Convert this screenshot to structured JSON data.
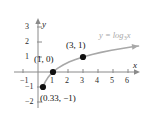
{
  "chart_data": {
    "type": "line",
    "title": "",
    "xlabel": "x",
    "ylabel": "y",
    "xlim": [
      -1.6,
      6.8
    ],
    "ylim": [
      -2.4,
      3.6
    ],
    "grid": false,
    "legend_position": "inline-right",
    "function_label": {
      "text": "y = log",
      "base": "3",
      "arg": "x",
      "color": "#a8a8a8"
    },
    "series": [
      {
        "name": "y = log_3 x",
        "color": "#a8a8a8",
        "arrow_end": true,
        "x": [
          0.3,
          0.33,
          0.4,
          0.5,
          0.65,
          0.8,
          1.0,
          1.3,
          1.7,
          2.1,
          2.5,
          3.0,
          3.6,
          4.2,
          4.9,
          5.6,
          6.3,
          6.7
        ],
        "y": [
          -1.1,
          -1.0,
          -0.83,
          -0.63,
          -0.39,
          -0.2,
          0.0,
          0.24,
          0.48,
          0.68,
          0.83,
          1.0,
          1.17,
          1.31,
          1.45,
          1.57,
          1.68,
          1.73
        ]
      }
    ],
    "points": [
      {
        "label": "(1, 0)",
        "x": 1,
        "y": 0,
        "label_dx": -19,
        "label_dy": -17
      },
      {
        "label": "(3, 1)",
        "x": 3,
        "y": 1,
        "label_dx": -17,
        "label_dy": -16
      },
      {
        "label": "(0.33, −1)",
        "x": 0.33,
        "y": -1,
        "label_dx": -3,
        "label_dy": 7
      }
    ],
    "x_ticks": [
      {
        "value": -1,
        "label": "−1"
      },
      {
        "value": 1,
        "label": "1"
      },
      {
        "value": 2,
        "label": "2"
      },
      {
        "value": 3,
        "label": "3"
      },
      {
        "value": 4,
        "label": "4"
      },
      {
        "value": 5,
        "label": "5"
      },
      {
        "value": 6,
        "label": "6"
      }
    ],
    "y_ticks": [
      {
        "value": 3,
        "label": "3"
      },
      {
        "value": 2,
        "label": "2"
      },
      {
        "value": 1,
        "label": "1"
      },
      {
        "value": -1,
        "label": "−1"
      },
      {
        "value": -2,
        "label": "−2"
      }
    ],
    "axis_color": "#8a8a8a",
    "point_color": "#111111"
  }
}
